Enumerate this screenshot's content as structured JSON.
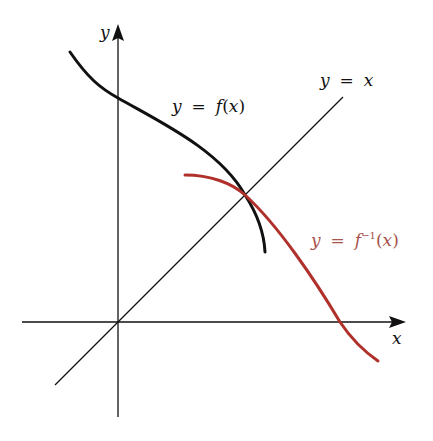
{
  "diagram": {
    "title": "",
    "axes": {
      "x_label": "x",
      "y_label": "y"
    },
    "labels": {
      "identity": {
        "y": "y",
        "eq": "=",
        "x": "x"
      },
      "f": {
        "y": "y",
        "eq": "=",
        "fn": "f",
        "open": "(",
        "x": "x",
        "close": ")"
      },
      "finv": {
        "y": "y",
        "eq": "=",
        "fn": "f",
        "sup": "−1",
        "open": "(",
        "x": "x",
        "close": ")"
      }
    },
    "curves": [
      {
        "name": "f",
        "label": "y = f(x)",
        "color": "#111111"
      },
      {
        "name": "f-inverse",
        "label": "y = f⁻¹(x)",
        "color": "#b0312b"
      },
      {
        "name": "identity-line",
        "label": "y = x",
        "color": "#111111"
      }
    ],
    "colors": {
      "axis": "#111111",
      "f": "#111111",
      "finv": "#b0312b",
      "finv_label": "#a8524c"
    }
  }
}
